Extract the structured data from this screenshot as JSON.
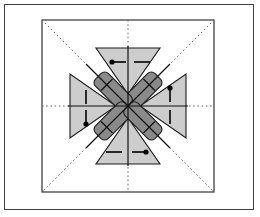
{
  "figure": {
    "background_color": "#ffffff",
    "outer_frame": {
      "name": "outer-frame",
      "x": 4,
      "y": 4,
      "width": 250,
      "height": 206,
      "stroke_color": "#404040",
      "stroke_width": 1,
      "fill": "#ffffff"
    },
    "inner_square": {
      "name": "inner-square",
      "x": 42,
      "y": 20,
      "width": 172,
      "height": 172,
      "stroke_color": "#333333",
      "stroke_width": 1.2,
      "fill": "#ffffff"
    },
    "center": {
      "x": 128,
      "y": 106
    },
    "colors": {
      "triangle_fill": "#cdcdcd",
      "triangle_stroke": "#1a1a1a",
      "arm_fill": "#8a8a8a",
      "arm_stroke": "#1a1a1a",
      "guide_dotted": "#666666",
      "axis_solid": "#111111",
      "marker": "#000000"
    },
    "guides": {
      "name": "guide-lines",
      "style": "dotted",
      "lines": [
        {
          "name": "horizontal-dotted-axis",
          "x1": 42,
          "y1": 106,
          "x2": 214,
          "y2": 106
        },
        {
          "name": "vertical-dotted-axis",
          "x1": 128,
          "y1": 20,
          "x2": 128,
          "y2": 192
        },
        {
          "name": "diagonal-dotted-nw-se",
          "x1": 42,
          "y1": 20,
          "x2": 214,
          "y2": 192
        },
        {
          "name": "diagonal-dotted-ne-sw",
          "x1": 214,
          "y1": 20,
          "x2": 42,
          "y2": 192
        }
      ]
    },
    "solid_axes": {
      "name": "solid-axes",
      "lines": [
        {
          "name": "solid-horizontal-axis",
          "x1": 68,
          "y1": 106,
          "x2": 188,
          "y2": 106
        },
        {
          "name": "solid-vertical-axis",
          "x1": 128,
          "y1": 46,
          "x2": 128,
          "y2": 166
        },
        {
          "name": "solid-diagonal-nw-se",
          "x1": 86,
          "y1": 64,
          "x2": 170,
          "y2": 148
        },
        {
          "name": "solid-diagonal-ne-sw",
          "x1": 170,
          "y1": 64,
          "x2": 86,
          "y2": 148
        }
      ]
    },
    "triangles": [
      {
        "name": "triangle-north",
        "direction": "points-down",
        "points": "96,48 160,48 128,94",
        "label": "north"
      },
      {
        "name": "triangle-south",
        "direction": "points-up",
        "points": "96,164 160,164 128,118",
        "label": "south"
      },
      {
        "name": "triangle-west",
        "direction": "points-right",
        "points": "70,74 70,138 116,106",
        "label": "west"
      },
      {
        "name": "triangle-east",
        "direction": "points-left",
        "points": "186,74 186,138 140,106",
        "label": "east"
      }
    ],
    "arms": [
      {
        "name": "arm-northwest",
        "angle": 45,
        "label": "nw-arm"
      },
      {
        "name": "arm-northeast",
        "angle": -45,
        "label": "ne-arm"
      },
      {
        "name": "arm-southeast",
        "angle": 45,
        "label": "se-arm"
      },
      {
        "name": "arm-southwest",
        "angle": -45,
        "label": "sw-arm"
      }
    ],
    "markers": [
      {
        "name": "marker-north-dot-left",
        "type": "dot-line",
        "orientation": "horizontal",
        "dot_x": 112,
        "dot_y": 62,
        "line_x2": 128,
        "note": "dot with bar, top-left"
      },
      {
        "name": "marker-north-bar-right",
        "type": "bar",
        "orientation": "horizontal",
        "x1": 134,
        "y1": 62,
        "x2": 150,
        "note": "plain bar, top-right"
      },
      {
        "name": "marker-south-bar-left",
        "type": "bar",
        "orientation": "horizontal",
        "x1": 106,
        "y1": 152,
        "x2": 122,
        "note": "plain bar, bottom-left"
      },
      {
        "name": "marker-south-dot-right",
        "type": "dot-line",
        "orientation": "horizontal",
        "dot_x": 146,
        "dot_y": 152,
        "line_x2": 132,
        "note": "dot with bar, bottom-right"
      },
      {
        "name": "marker-west-bar-top",
        "type": "bar",
        "orientation": "vertical",
        "x1": 86,
        "y1": 90,
        "y2": 104,
        "note": "plain bar, left-upper"
      },
      {
        "name": "marker-west-dot-bottom",
        "type": "dot-line",
        "orientation": "vertical",
        "dot_x": 86,
        "dot_y": 124,
        "line_y2": 110,
        "note": "dot with bar, left-lower"
      },
      {
        "name": "marker-east-dot-top",
        "type": "dot-line",
        "orientation": "vertical",
        "dot_x": 170,
        "dot_y": 88,
        "line_y2": 102,
        "note": "dot with bar, right-upper"
      },
      {
        "name": "marker-east-bar-bottom",
        "type": "bar",
        "orientation": "vertical",
        "x1": 170,
        "y1": 110,
        "y2": 124,
        "note": "plain bar, right-lower"
      }
    ],
    "arm_ticks": [
      {
        "name": "tick-nw-arm",
        "note": "cross tick on northwest arm"
      },
      {
        "name": "tick-ne-arm",
        "note": "cross tick on northeast arm"
      },
      {
        "name": "tick-se-arm",
        "note": "cross tick on southeast arm"
      },
      {
        "name": "tick-sw-arm",
        "note": "cross tick on southwest arm"
      }
    ]
  }
}
